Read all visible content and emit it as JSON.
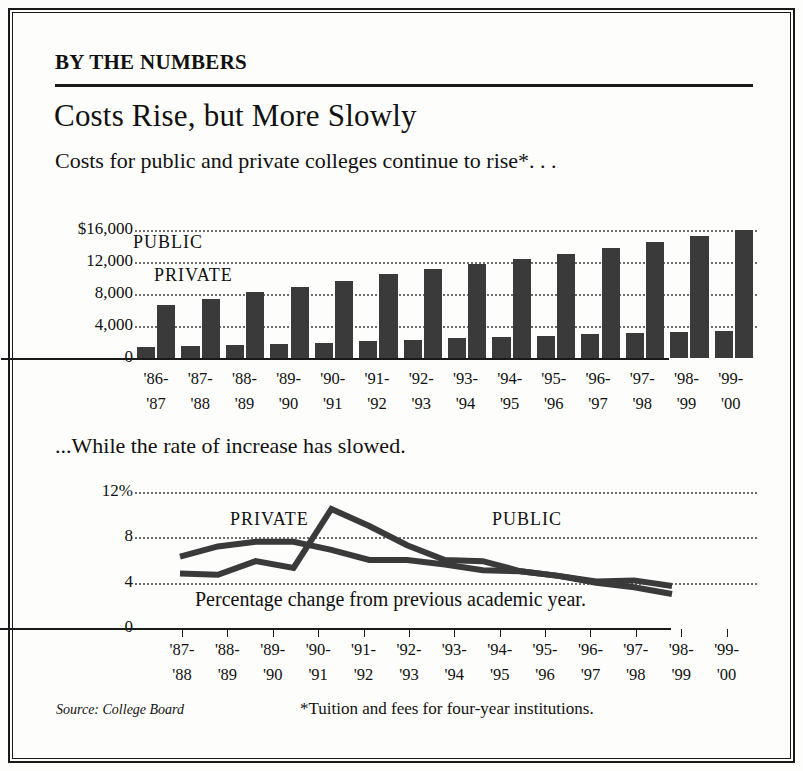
{
  "kicker": "BY THE NUMBERS",
  "headline": "Costs Rise, but More Slowly",
  "deck": "Costs for public and private colleges continue to rise*. . .",
  "subdeck": "...While the rate of increase has slowed.",
  "source": "Source: College Board",
  "footnote": "*Tuition and fees for four-year institutions.",
  "chart_data": [
    {
      "type": "bar",
      "title": "Costs for public and private colleges continue to rise*",
      "xlabel": "",
      "ylabel": "",
      "ylim": [
        0,
        16000
      ],
      "grid": true,
      "ytick_labels": [
        "$16,000",
        "12,000",
        "8,000",
        "4,000",
        "0"
      ],
      "ytick_values": [
        16000,
        12000,
        8000,
        4000,
        0
      ],
      "categories": [
        "'86-\n'87",
        "'87-\n'88",
        "'88-\n'89",
        "'89-\n'90",
        "'90-\n'91",
        "'91-\n'92",
        "'92-\n'93",
        "'93-\n'94",
        "'94-\n'95",
        "'95-\n'96",
        "'96-\n'97",
        "'97-\n'98",
        "'98-\n'99",
        "'99-\n'00"
      ],
      "categories_top": [
        "'86-",
        "'87-",
        "'88-",
        "'89-",
        "'90-",
        "'91-",
        "'92-",
        "'93-",
        "'94-",
        "'95-",
        "'96-",
        "'97-",
        "'98-",
        "'99-"
      ],
      "categories_bottom": [
        "'87",
        "'88",
        "'89",
        "'90",
        "'91",
        "'92",
        "'93",
        "'94",
        "'95",
        "'96",
        "'97",
        "'98",
        "'99",
        "'00"
      ],
      "legend": [
        "PUBLIC",
        "PRIVATE"
      ],
      "legend_position": "inside-upper-left",
      "series": [
        {
          "name": "PUBLIC",
          "values": [
            1400,
            1550,
            1650,
            1750,
            1900,
            2100,
            2300,
            2500,
            2650,
            2800,
            2950,
            3100,
            3250,
            3400
          ]
        },
        {
          "name": "PRIVATE",
          "values": [
            6600,
            7400,
            8200,
            8900,
            9600,
            10500,
            11100,
            11800,
            12400,
            13000,
            13700,
            14500,
            15300,
            16000
          ]
        }
      ]
    },
    {
      "type": "line",
      "title": "...While the rate of increase has slowed.",
      "caption": "Percentage change from previous academic year.",
      "xlabel": "",
      "ylabel": "",
      "ylim": [
        0,
        12
      ],
      "grid": true,
      "ytick_labels": [
        "12%",
        "8",
        "4",
        "0"
      ],
      "ytick_values": [
        12,
        8,
        4,
        0
      ],
      "categories_top": [
        "'87-",
        "'88-",
        "'89-",
        "'90-",
        "'91-",
        "'92-",
        "'93-",
        "'94-",
        "'95-",
        "'96-",
        "'97-",
        "'98-",
        "'99-"
      ],
      "categories_bottom": [
        "'88",
        "'89",
        "'90",
        "'91",
        "'92",
        "'93",
        "'94",
        "'95",
        "'96",
        "'97",
        "'98",
        "'99",
        "'00"
      ],
      "legend": [
        "PRIVATE",
        "PUBLIC"
      ],
      "legend_position": "inline-on-series",
      "series": [
        {
          "name": "PRIVATE",
          "values": [
            6.3,
            7.2,
            7.6,
            7.6,
            6.9,
            6.0,
            6.0,
            5.6,
            5.1,
            5.0,
            4.6,
            4.1,
            4.2,
            3.7
          ]
        },
        {
          "name": "PUBLIC",
          "values": [
            4.8,
            4.7,
            5.9,
            5.3,
            10.5,
            9.0,
            7.3,
            6.0,
            5.9,
            5.0,
            4.6,
            4.0,
            3.6,
            3.0
          ]
        }
      ]
    }
  ]
}
